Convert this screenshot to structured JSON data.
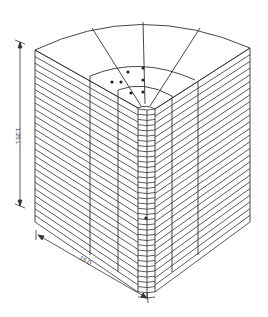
{
  "diagram": {
    "type": "3D finite element mesh of cylindrical sector (quarter section)",
    "dimensions": {
      "height_label": "1.25 L",
      "width_label": "15 D"
    },
    "colors": {
      "background": "#ffffff",
      "line": "#333333"
    },
    "mesh": {
      "outer_face_layers": 26,
      "radial_segments_top": 4,
      "inner_column": "refined core mesh along axis",
      "markers": "dots on top radial lines near core"
    }
  }
}
